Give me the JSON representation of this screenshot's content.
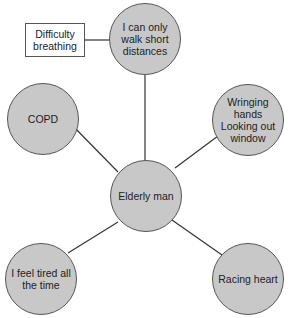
{
  "diagram": {
    "center": {
      "label": "Elderly man"
    },
    "nodes": [
      {
        "id": "walk",
        "label": "I can only\nwalk short\ndistances"
      },
      {
        "id": "copd",
        "label": "COPD"
      },
      {
        "id": "wringing",
        "label": "Wringing\nhands\nLooking out\nwindow"
      },
      {
        "id": "tired",
        "label": "I feel tired all\nthe time"
      },
      {
        "id": "racing",
        "label": "Racing heart"
      }
    ],
    "annotation": {
      "label": "Difficulty\nbreathing"
    },
    "colors": {
      "node_fill": "#c8c8c8",
      "stroke": "#555555",
      "box_fill": "#ffffff"
    }
  }
}
